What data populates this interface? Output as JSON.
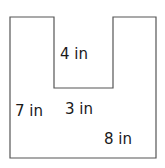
{
  "figure": {
    "shape": "U-shaped polygon",
    "stroke_color": "#555555",
    "labels": {
      "top_notch": "4 in",
      "left_side": "7 in",
      "notch_bottom": "3 in",
      "bottom": "8 in"
    }
  }
}
